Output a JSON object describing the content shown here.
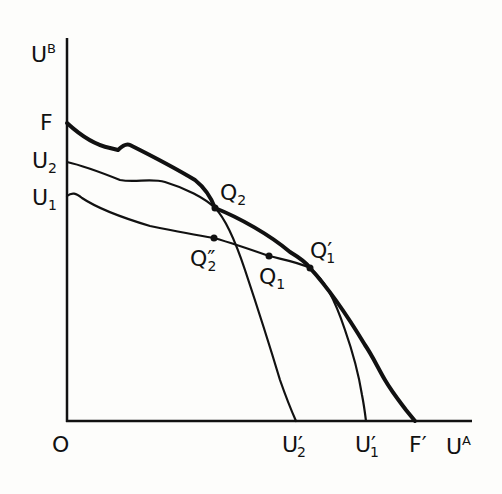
{
  "diagram": {
    "type": "utility-possibility-frontier",
    "axes": {
      "y_label": {
        "base": "U",
        "sup": "B"
      },
      "x_label": {
        "base": "U",
        "sup": "A"
      },
      "origin": "O"
    },
    "y_intercepts": [
      {
        "id": "F",
        "base": "F",
        "sub": ""
      },
      {
        "id": "U2",
        "base": "U",
        "sub": "2"
      },
      {
        "id": "U1",
        "base": "U",
        "sub": "1"
      }
    ],
    "x_intercepts": [
      {
        "id": "U2p",
        "base": "U",
        "sub": "2",
        "prime": "′"
      },
      {
        "id": "U1p",
        "base": "U",
        "sub": "1",
        "prime": "′"
      },
      {
        "id": "Fp",
        "base": "F",
        "sub": "",
        "prime": "′"
      }
    ],
    "points": [
      {
        "id": "Q2",
        "base": "Q",
        "sub": "2",
        "prime": ""
      },
      {
        "id": "Q2pp",
        "base": "Q",
        "sub": "2",
        "prime": "″"
      },
      {
        "id": "Q1",
        "base": "Q",
        "sub": "1",
        "prime": ""
      },
      {
        "id": "Q1p",
        "base": "Q",
        "sub": "1",
        "prime": "′"
      }
    ],
    "curves": [
      {
        "id": "FF'",
        "name": "Utility possibility frontier",
        "weight": "thick"
      },
      {
        "id": "U2U2'",
        "name": "Utility possibility curve 2",
        "weight": "thin"
      },
      {
        "id": "U1U1'",
        "name": "Utility possibility curve 1",
        "weight": "thin"
      }
    ]
  }
}
